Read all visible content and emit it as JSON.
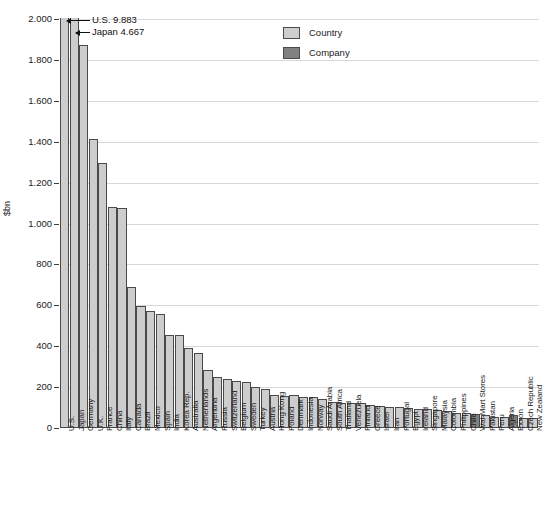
{
  "chart_data": {
    "type": "bar",
    "title": "",
    "xlabel": "",
    "ylabel": "$bn",
    "ylim": [
      0,
      2000
    ],
    "ytick_labels": [
      "0",
      "200",
      "400",
      "600",
      "800",
      "1.000",
      "1.200",
      "1.400",
      "1.600",
      "1.800",
      "2.000"
    ],
    "ytick_values": [
      0,
      200,
      400,
      600,
      800,
      1000,
      1200,
      1400,
      1600,
      1800,
      2000
    ],
    "grid": true,
    "legend_position": "top-center",
    "legend": [
      {
        "label": "Country",
        "color": "#cdcdcd"
      },
      {
        "label": "Company",
        "color": "#818181"
      }
    ],
    "annotations": [
      {
        "text": "U.S. 9.883",
        "target": "U.S.",
        "value": 9883
      },
      {
        "text": "Japan 4.667",
        "target": "Japan",
        "value": 4667
      }
    ],
    "categories": [
      "U.S.",
      "Japan",
      "Germany",
      "U.K.",
      "France",
      "China",
      "Italy",
      "Canada",
      "Brazil",
      "Mexico",
      "Spain",
      "India",
      "Korea Rep.",
      "Australia",
      "Netherlands",
      "Argentina",
      "Russia",
      "Switzerland",
      "Belgium",
      "Sweden",
      "Turkey",
      "Austria",
      "Hong Kong",
      "Poland",
      "Denmark",
      "Indonesia",
      "Norway",
      "Saudi Arabia",
      "South Africa",
      "Thailand",
      "Venezuela",
      "Finland",
      "Greece",
      "Israel",
      "Iran",
      "Portugal",
      "Egypt",
      "Ireland",
      "Singapore",
      "Malaysia",
      "Colombia",
      "Philippines",
      "Chile",
      "Wal-Mart Stores",
      "Pakistan",
      "Peru",
      "Algeria",
      "Exxon",
      "Czech Republic",
      "New Zealand"
    ],
    "values": [
      9883,
      4667,
      1873,
      1414,
      1294,
      1080,
      1074,
      688,
      595,
      574,
      558,
      457,
      457,
      390,
      365,
      285,
      251,
      240,
      229,
      227,
      200,
      189,
      163,
      158,
      162,
      153,
      152,
      140,
      126,
      122,
      121,
      121,
      113,
      110,
      105,
      105,
      99,
      95,
      92,
      88,
      81,
      75,
      71,
      67,
      62,
      54,
      53,
      63,
      51,
      50
    ],
    "groups": [
      "Country",
      "Country",
      "Country",
      "Country",
      "Country",
      "Country",
      "Country",
      "Country",
      "Country",
      "Country",
      "Country",
      "Country",
      "Country",
      "Country",
      "Country",
      "Country",
      "Country",
      "Country",
      "Country",
      "Country",
      "Country",
      "Country",
      "Country",
      "Country",
      "Country",
      "Country",
      "Country",
      "Country",
      "Country",
      "Country",
      "Country",
      "Country",
      "Country",
      "Country",
      "Country",
      "Country",
      "Country",
      "Country",
      "Country",
      "Country",
      "Country",
      "Country",
      "Country",
      "Company",
      "Country",
      "Country",
      "Country",
      "Company",
      "Country",
      "Country"
    ],
    "clipped_max": 2000
  }
}
